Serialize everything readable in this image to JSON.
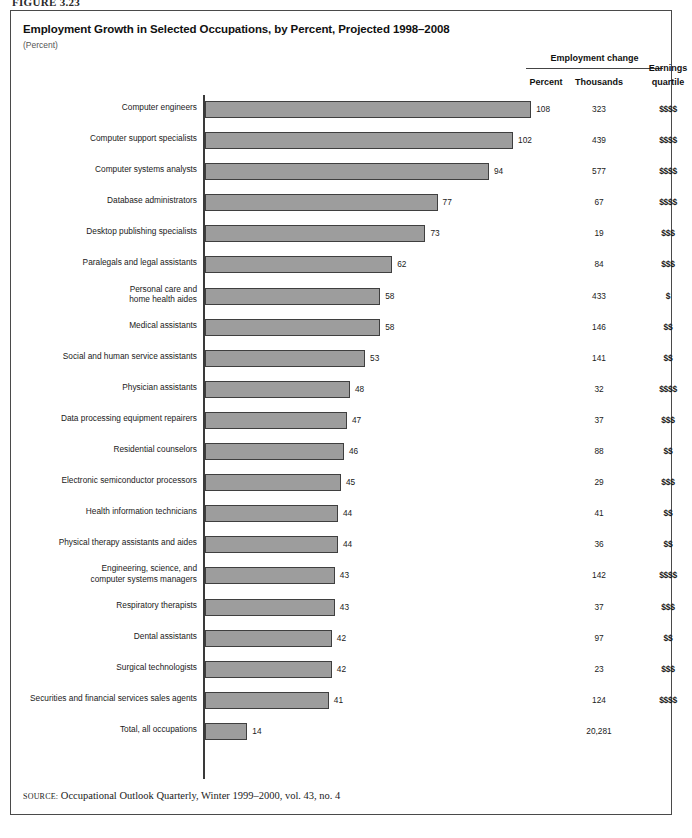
{
  "figure_caption": "FIGURE 3.23",
  "title": "Employment Growth in Selected Occupations, by Percent, Projected 1998–2008",
  "subtitle": "(Percent)",
  "headers": {
    "employment_change": "Employment change",
    "percent": "Percent",
    "thousands": "Thousands",
    "earnings_line1": "Earnings",
    "earnings_line2": "quartile"
  },
  "source": {
    "label": "SOURCE:",
    "text": " Occupational Outlook Quarterly, Winter 1999–2000, vol. 43, no. 4"
  },
  "colors": {
    "bar_fill": "#9d9d9d",
    "bar_border": "#3f3f3f",
    "frame": "#4a4a4a",
    "axis": "#3a3a3a"
  },
  "chart_data": {
    "type": "bar",
    "orientation": "horizontal",
    "title": "Employment Growth in Selected Occupations, by Percent, Projected 1998–2008",
    "xlabel": "Percent",
    "ylabel": "",
    "xlim": [
      0,
      110
    ],
    "grid": false,
    "legend": "none",
    "categories": [
      "Computer engineers",
      "Computer support specialists",
      "Computer systems analysts",
      "Database administrators",
      "Desktop publishing specialists",
      "Paralegals and legal assistants",
      "Personal care and home health aides",
      "Medical assistants",
      "Social and human service assistants",
      "Physician assistants",
      "Data processing equipment repairers",
      "Residential counselors",
      "Electronic semiconductor processors",
      "Health information technicians",
      "Physical therapy assistants and aides",
      "Engineering, science, and computer systems managers",
      "Respiratory therapists",
      "Dental assistants",
      "Surgical technologists",
      "Securities and financial services sales agents",
      "Total, all occupations"
    ],
    "values": [
      108,
      102,
      94,
      77,
      73,
      62,
      58,
      58,
      53,
      48,
      47,
      46,
      45,
      44,
      44,
      43,
      43,
      42,
      42,
      41,
      14
    ],
    "series": [
      {
        "name": "Employment change, percent",
        "values": [
          108,
          102,
          94,
          77,
          73,
          62,
          58,
          58,
          53,
          48,
          47,
          46,
          45,
          44,
          44,
          43,
          43,
          42,
          42,
          41,
          14
        ]
      },
      {
        "name": "Employment change, thousands",
        "values": [
          "323",
          "439",
          "577",
          "67",
          "19",
          "84",
          "433",
          "146",
          "141",
          "32",
          "37",
          "88",
          "29",
          "41",
          "36",
          "142",
          "37",
          "97",
          "23",
          "124",
          "20,281"
        ]
      },
      {
        "name": "Earnings quartile",
        "values": [
          "$$$$",
          "$$$$",
          "$$$$",
          "$$$$",
          "$$$",
          "$$$",
          "$",
          "$$",
          "$$",
          "$$$$",
          "$$$",
          "$$",
          "$$$",
          "$$",
          "$$",
          "$$$$",
          "$$$",
          "$$",
          "$$$",
          "$$$$",
          ""
        ]
      }
    ]
  },
  "rows": [
    {
      "label_lines": [
        "Computer engineers"
      ],
      "percent": 108,
      "percent_text": "108",
      "thousands": "323",
      "earnings": "$$$$"
    },
    {
      "label_lines": [
        "Computer support specialists"
      ],
      "percent": 102,
      "percent_text": "102",
      "thousands": "439",
      "earnings": "$$$$"
    },
    {
      "label_lines": [
        "Computer systems analysts"
      ],
      "percent": 94,
      "percent_text": "94",
      "thousands": "577",
      "earnings": "$$$$"
    },
    {
      "label_lines": [
        "Database administrators"
      ],
      "percent": 77,
      "percent_text": "77",
      "thousands": "67",
      "earnings": "$$$$"
    },
    {
      "label_lines": [
        "Desktop publishing specialists"
      ],
      "percent": 73,
      "percent_text": "73",
      "thousands": "19",
      "earnings": "$$$"
    },
    {
      "label_lines": [
        "Paralegals and legal assistants"
      ],
      "percent": 62,
      "percent_text": "62",
      "thousands": "84",
      "earnings": "$$$"
    },
    {
      "label_lines": [
        "Personal care and",
        "home health aides"
      ],
      "percent": 58,
      "percent_text": "58",
      "thousands": "433",
      "earnings": "$"
    },
    {
      "label_lines": [
        "Medical assistants"
      ],
      "percent": 58,
      "percent_text": "58",
      "thousands": "146",
      "earnings": "$$"
    },
    {
      "label_lines": [
        "Social and human service assistants"
      ],
      "percent": 53,
      "percent_text": "53",
      "thousands": "141",
      "earnings": "$$"
    },
    {
      "label_lines": [
        "Physician assistants"
      ],
      "percent": 48,
      "percent_text": "48",
      "thousands": "32",
      "earnings": "$$$$"
    },
    {
      "label_lines": [
        "Data processing equipment repairers"
      ],
      "percent": 47,
      "percent_text": "47",
      "thousands": "37",
      "earnings": "$$$"
    },
    {
      "label_lines": [
        "Residential counselors"
      ],
      "percent": 46,
      "percent_text": "46",
      "thousands": "88",
      "earnings": "$$"
    },
    {
      "label_lines": [
        "Electronic semiconductor processors"
      ],
      "percent": 45,
      "percent_text": "45",
      "thousands": "29",
      "earnings": "$$$"
    },
    {
      "label_lines": [
        "Health information technicians"
      ],
      "percent": 44,
      "percent_text": "44",
      "thousands": "41",
      "earnings": "$$"
    },
    {
      "label_lines": [
        "Physical therapy assistants and aides"
      ],
      "percent": 44,
      "percent_text": "44",
      "thousands": "36",
      "earnings": "$$"
    },
    {
      "label_lines": [
        "Engineering, science, and",
        "computer systems managers"
      ],
      "percent": 43,
      "percent_text": "43",
      "thousands": "142",
      "earnings": "$$$$"
    },
    {
      "label_lines": [
        "Respiratory therapists"
      ],
      "percent": 43,
      "percent_text": "43",
      "thousands": "37",
      "earnings": "$$$"
    },
    {
      "label_lines": [
        "Dental assistants"
      ],
      "percent": 42,
      "percent_text": "42",
      "thousands": "97",
      "earnings": "$$"
    },
    {
      "label_lines": [
        "Surgical technologists"
      ],
      "percent": 42,
      "percent_text": "42",
      "thousands": "23",
      "earnings": "$$$"
    },
    {
      "label_lines": [
        "Securities and financial services sales agents"
      ],
      "percent": 41,
      "percent_text": "41",
      "thousands": "124",
      "earnings": "$$$$"
    },
    {
      "label_lines": [
        "Total, all occupations"
      ],
      "percent": 14,
      "percent_text": "14",
      "thousands": "20,281",
      "earnings": ""
    }
  ]
}
